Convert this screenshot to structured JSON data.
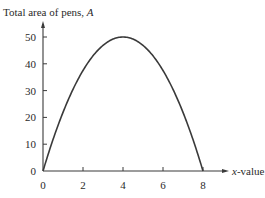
{
  "chart_data": {
    "type": "line",
    "title": "",
    "xlabel": "x-value",
    "ylabel": "Total area of pens, A",
    "xlim": [
      0,
      8
    ],
    "ylim": [
      0,
      50
    ],
    "x_ticks": [
      0,
      2,
      4,
      6,
      8
    ],
    "y_ticks": [
      0,
      10,
      20,
      30,
      40,
      50
    ],
    "grid": false,
    "legend": null,
    "series": [
      {
        "name": "A(x)",
        "x": [
          0,
          0.5,
          1,
          1.5,
          2,
          2.5,
          3,
          3.5,
          4,
          4.5,
          5,
          5.5,
          6,
          6.5,
          7,
          7.5,
          8
        ],
        "values": [
          0,
          11.7,
          21.9,
          30.5,
          37.5,
          42.9,
          46.9,
          49.2,
          50,
          49.2,
          46.9,
          42.9,
          37.5,
          30.5,
          21.9,
          11.7,
          0
        ]
      }
    ],
    "colors": {
      "line": "#3a3a3a",
      "axes": "#3a3a3a",
      "text": "#2a2a2a"
    }
  },
  "labels": {
    "ylabel_text": "Total area of pens, ",
    "ylabel_var": "A",
    "xlabel_var": "x",
    "xlabel_text": "-value"
  }
}
